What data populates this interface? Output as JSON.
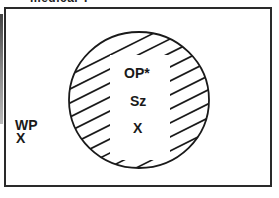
{
  "caption": "medical T",
  "diagram": {
    "outside_labels": [
      "WP",
      "X"
    ],
    "circle_labels": [
      "OP*",
      "Sz",
      "X"
    ],
    "hatch_color": "#1a1a1a",
    "frame_color": "#2a2a2a"
  }
}
